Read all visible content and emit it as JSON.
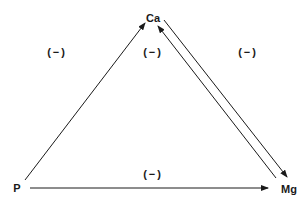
{
  "diagram": {
    "nodes": [
      {
        "id": "Ca",
        "label": "Ca",
        "x": 153,
        "y": 18
      },
      {
        "id": "P",
        "label": "P",
        "x": 17,
        "y": 188
      },
      {
        "id": "Mg",
        "label": "Mg",
        "x": 289,
        "y": 188
      }
    ],
    "edges": [
      {
        "from": "P",
        "to": "Ca"
      },
      {
        "from": "Ca",
        "to": "Mg"
      },
      {
        "from": "Mg",
        "to": "Ca"
      },
      {
        "from": "P",
        "to": "Mg"
      }
    ],
    "signs": [
      {
        "label": "(−)",
        "x": 57,
        "y": 52
      },
      {
        "label": "(−)",
        "x": 153,
        "y": 52
      },
      {
        "label": "(−)",
        "x": 248,
        "y": 52
      },
      {
        "label": "(−)",
        "x": 153,
        "y": 174
      }
    ],
    "line_color": "#1a1a1a"
  }
}
